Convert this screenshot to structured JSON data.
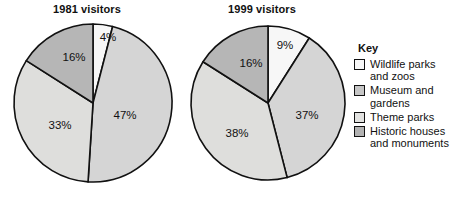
{
  "chart_data": [
    {
      "type": "pie",
      "title": "1981 visitors",
      "categories": [
        "Wildlife parks and zoos",
        "Museum and gardens",
        "Theme parks",
        "Historic houses and monuments"
      ],
      "values": [
        4,
        47,
        33,
        16
      ],
      "labels": [
        "4%",
        "47%",
        "33%",
        "16%"
      ],
      "colors": [
        "#f7f7f7",
        "#d5d5d5",
        "#dededc",
        "#b6b6b6"
      ],
      "start_angle_deg": 0,
      "direction": "clockwise",
      "units": "percent",
      "legend_position": "right"
    },
    {
      "type": "pie",
      "title": "1999 visitors",
      "categories": [
        "Wildlife parks and zoos",
        "Museum and gardens",
        "Theme parks",
        "Historic houses and monuments"
      ],
      "values": [
        9,
        37,
        38,
        16
      ],
      "labels": [
        "9%",
        "37%",
        "38%",
        "16%"
      ],
      "colors": [
        "#f7f7f7",
        "#d5d5d5",
        "#dededc",
        "#b6b6b6"
      ],
      "start_angle_deg": 0,
      "direction": "clockwise",
      "units": "percent",
      "legend_position": "right"
    }
  ],
  "charts": {
    "left": {
      "title": "1981 visitors",
      "slices": [
        {
          "label": "4%",
          "value": 4,
          "color": "#f7f7f7",
          "label_x": 96,
          "label_y": 16
        },
        {
          "label": "47%",
          "value": 47,
          "color": "#d5d5d5",
          "label_x": 113,
          "label_y": 94
        },
        {
          "label": "33%",
          "value": 33,
          "color": "#dededc",
          "label_x": 48,
          "label_y": 104
        },
        {
          "label": "16%",
          "value": 16,
          "color": "#b6b6b6",
          "label_x": 62,
          "label_y": 36
        }
      ]
    },
    "right": {
      "title": "1999 visitors",
      "slices": [
        {
          "label": "9%",
          "value": 9,
          "color": "#f7f7f7",
          "label_x": 96,
          "label_y": 22
        },
        {
          "label": "37%",
          "value": 37,
          "color": "#d5d5d5",
          "label_x": 118,
          "label_y": 92
        },
        {
          "label": "38%",
          "value": 38,
          "color": "#dededc",
          "label_x": 48,
          "label_y": 110
        },
        {
          "label": "16%",
          "value": 16,
          "color": "#b6b6b6",
          "label_x": 62,
          "label_y": 40
        }
      ]
    }
  },
  "legend": {
    "title": "Key",
    "items": [
      {
        "label": "Wildlife parks\nand zoos",
        "color": "#f7f7f7",
        "swatch_name": "legend-swatch-wildlife"
      },
      {
        "label": "Museum and\ngardens",
        "color": "#c6c6c6",
        "swatch_name": "legend-swatch-museum"
      },
      {
        "label": "Theme parks",
        "color": "#e2e2e0",
        "swatch_name": "legend-swatch-theme"
      },
      {
        "label": "Historic houses\nand monuments",
        "color": "#b2b2b2",
        "swatch_name": "legend-swatch-historic"
      }
    ]
  }
}
